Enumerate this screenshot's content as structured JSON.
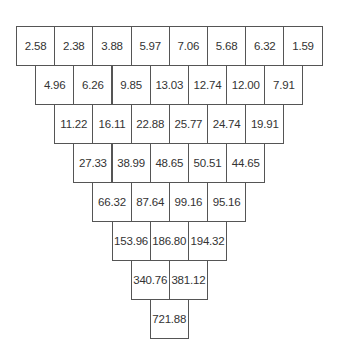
{
  "diagram": {
    "type": "inverted-number-pyramid",
    "rows": [
      [
        "2.58",
        "2.38",
        "3.88",
        "5.97",
        "7.06",
        "5.68",
        "6.32",
        "1.59"
      ],
      [
        "4.96",
        "6.26",
        "9.85",
        "13.03",
        "12.74",
        "12.00",
        "7.91"
      ],
      [
        "11.22",
        "16.11",
        "22.88",
        "25.77",
        "24.74",
        "19.91"
      ],
      [
        "27.33",
        "38.99",
        "48.65",
        "50.51",
        "44.65"
      ],
      [
        "66.32",
        "87.64",
        "99.16",
        "95.16"
      ],
      [
        "153.96",
        "186.80",
        "194.32"
      ],
      [
        "340.76",
        "381.12"
      ],
      [
        "721.88"
      ]
    ]
  }
}
